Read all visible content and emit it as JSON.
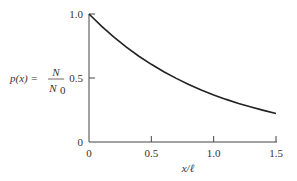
{
  "chart_data": {
    "type": "line",
    "title": "",
    "xlabel": "x/ℓ",
    "ylabel": "p(x) = N/N0",
    "ylabel_parts": {
      "lhs": "p(x) =",
      "numerator": "N",
      "denominator": "N",
      "denominator_sub": "0"
    },
    "xlim": [
      0,
      1.5
    ],
    "ylim": [
      0,
      1.0
    ],
    "x_ticks": [
      0,
      0.5,
      1.0,
      1.5
    ],
    "x_tick_labels": [
      "0",
      "0.5",
      "1.0",
      "1.5"
    ],
    "y_ticks": [
      0,
      0.5,
      1.0
    ],
    "y_tick_labels": [
      "0",
      "0.5",
      "1.0"
    ],
    "grid": false,
    "legend": null,
    "series": [
      {
        "name": "p(x)",
        "function": "exp(-x/ℓ)",
        "x": [
          0,
          0.1,
          0.2,
          0.3,
          0.4,
          0.5,
          0.6,
          0.7,
          0.8,
          0.9,
          1.0,
          1.1,
          1.2,
          1.3,
          1.4,
          1.5
        ],
        "y": [
          1.0,
          0.905,
          0.819,
          0.741,
          0.67,
          0.607,
          0.549,
          0.497,
          0.449,
          0.407,
          0.368,
          0.333,
          0.301,
          0.273,
          0.247,
          0.223
        ]
      }
    ],
    "color": "#222222"
  }
}
